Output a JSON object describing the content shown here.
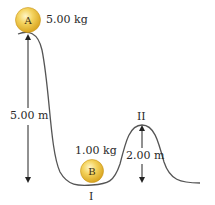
{
  "figure": {
    "ball_a": {
      "letter": "A",
      "mass_label": "5.00 kg",
      "color": "#f2c84b"
    },
    "ball_b": {
      "letter": "B",
      "mass_label": "1.00 kg",
      "color": "#f2c84b"
    },
    "height_main": "5.00 m",
    "height_hump": "2.00 m",
    "point_i": "I",
    "point_ii": "II",
    "track_color": "#555555",
    "arrow_color": "#222222"
  }
}
